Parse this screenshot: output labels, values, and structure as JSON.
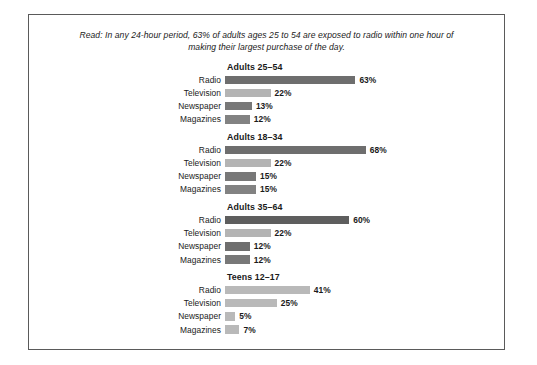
{
  "caption": "Read: In any 24-hour period, 63% of adults ages 25 to 54 are exposed to radio within one hour of making their largest purchase of the day.",
  "colors": {
    "border": "#5a5a5a",
    "text": "#1a1a1a",
    "radio": "#6e6e6e",
    "television": "#b4b4b4",
    "newspaper": "#787878",
    "magazines": "#828282",
    "teens_bar": "#b9b9b9"
  },
  "chart_data": {
    "type": "bar",
    "title": "",
    "xlabel": "",
    "ylabel": "",
    "xlim": [
      0,
      100
    ],
    "grid": false,
    "legend": "none",
    "orientation": "horizontal",
    "px_per_percent": 2.07,
    "categories": [
      "Radio",
      "Television",
      "Newspaper",
      "Magazines"
    ],
    "panels": [
      {
        "title": "Adults 25–54",
        "rows": [
          {
            "label": "Radio",
            "value": 63,
            "value_label": "63%",
            "color": "#6e6e6e"
          },
          {
            "label": "Television",
            "value": 22,
            "value_label": "22%",
            "color": "#b4b4b4"
          },
          {
            "label": "Newspaper",
            "value": 13,
            "value_label": "13%",
            "color": "#787878"
          },
          {
            "label": "Magazines",
            "value": 12,
            "value_label": "12%",
            "color": "#828282"
          }
        ]
      },
      {
        "title": "Adults 18–34",
        "rows": [
          {
            "label": "Radio",
            "value": 68,
            "value_label": "68%",
            "color": "#6e6e6e"
          },
          {
            "label": "Television",
            "value": 22,
            "value_label": "22%",
            "color": "#b4b4b4"
          },
          {
            "label": "Newspaper",
            "value": 15,
            "value_label": "15%",
            "color": "#787878"
          },
          {
            "label": "Magazines",
            "value": 15,
            "value_label": "15%",
            "color": "#828282"
          }
        ]
      },
      {
        "title": "Adults 35–64",
        "rows": [
          {
            "label": "Radio",
            "value": 60,
            "value_label": "60%",
            "color": "#5e5e5e"
          },
          {
            "label": "Television",
            "value": 22,
            "value_label": "22%",
            "color": "#b4b4b4"
          },
          {
            "label": "Newspaper",
            "value": 12,
            "value_label": "12%",
            "color": "#6e6e6e"
          },
          {
            "label": "Magazines",
            "value": 12,
            "value_label": "12%",
            "color": "#787878"
          }
        ]
      },
      {
        "title": "Teens 12–17",
        "rows": [
          {
            "label": "Radio",
            "value": 41,
            "value_label": "41%",
            "color": "#b9b9b9"
          },
          {
            "label": "Television",
            "value": 25,
            "value_label": "25%",
            "color": "#b9b9b9"
          },
          {
            "label": "Newspaper",
            "value": 5,
            "value_label": "5%",
            "color": "#b9b9b9"
          },
          {
            "label": "Magazines",
            "value": 7,
            "value_label": "7%",
            "color": "#b9b9b9"
          }
        ]
      }
    ]
  }
}
